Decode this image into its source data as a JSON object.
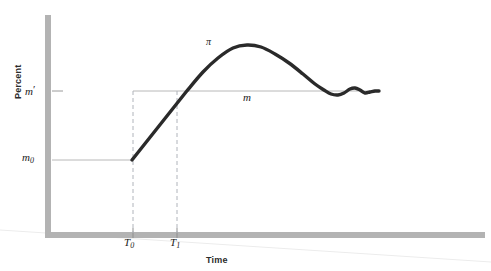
{
  "figure": {
    "background_color": "#ffffff",
    "axis_color": "#b3b3b3",
    "curve_color": "#2a2a2a",
    "guide_color": "#b8b8b8",
    "dash_color": "#b0b4bb"
  },
  "labels": {
    "y_axis_title": "Percent",
    "x_axis_title": "Time",
    "m_prime": "m",
    "m_prime_mark": "′",
    "m_zero": "m",
    "m_zero_sub": "0",
    "t_zero": "T",
    "t_zero_sub": "0",
    "t_one": "T",
    "t_one_sub": "1",
    "pi_curve": "π",
    "m_line": "m"
  },
  "chart_data": {
    "type": "line",
    "title": "",
    "xlabel": "Time",
    "ylabel": "Percent",
    "grid": false,
    "legend": false,
    "axis_ticks": {
      "y": [
        {
          "label": "m′",
          "value": 0.72
        },
        {
          "label": "m₀",
          "value": 0.33
        }
      ],
      "x": [
        {
          "label": "T₀",
          "value": 0.22
        },
        {
          "label": "T₁",
          "value": 0.35
        }
      ]
    },
    "series": [
      {
        "name": "π",
        "style": "thick-solid",
        "color": "#2a2a2a",
        "annotation": "π",
        "points": [
          [
            132,
            160
          ],
          [
            150,
            137
          ],
          [
            168,
            114
          ],
          [
            186,
            92
          ],
          [
            203,
            72
          ],
          [
            218,
            58
          ],
          [
            233,
            48
          ],
          [
            247,
            45
          ],
          [
            261,
            47
          ],
          [
            275,
            54
          ],
          [
            289,
            63
          ],
          [
            303,
            74
          ],
          [
            315,
            84
          ],
          [
            324,
            90
          ],
          [
            331,
            94
          ],
          [
            338,
            95
          ],
          [
            344,
            93
          ],
          [
            350,
            89
          ],
          [
            355,
            88
          ],
          [
            360,
            90
          ],
          [
            365,
            93
          ],
          [
            370,
            92
          ],
          [
            375,
            91
          ],
          [
            379,
            91
          ]
        ]
      },
      {
        "name": "m",
        "style": "thin-solid",
        "color": "#b8b8b8",
        "annotation": "m",
        "points": [
          [
            133,
            91
          ],
          [
            379,
            91
          ]
        ]
      },
      {
        "name": "m₀ guide",
        "style": "thin-solid",
        "color": "#b8b8b8",
        "points": [
          [
            47,
            160
          ],
          [
            132,
            160
          ]
        ]
      }
    ],
    "reference_lines": [
      {
        "name": "T₀ vertical",
        "style": "dashed",
        "x": 133,
        "y_from": 91,
        "y_to": 233
      },
      {
        "name": "T₁ vertical",
        "style": "dashed",
        "x": 177,
        "y_from": 91,
        "y_to": 233
      }
    ]
  }
}
